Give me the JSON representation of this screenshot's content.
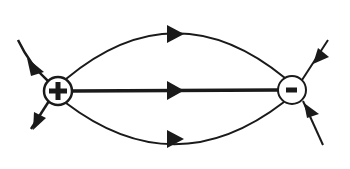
{
  "diagram": {
    "type": "electric-field-lines-dipole",
    "charges": [
      {
        "id": "positive",
        "symbol": "+",
        "cx": 58,
        "cy": 91,
        "r": 14
      },
      {
        "id": "negative",
        "symbol": "-",
        "cx": 292,
        "cy": 90,
        "r": 14
      }
    ],
    "field_lines": [
      {
        "id": "top-arc",
        "direction": "left-to-right"
      },
      {
        "id": "middle-line",
        "direction": "left-to-right"
      },
      {
        "id": "bottom-arc",
        "direction": "left-to-right"
      },
      {
        "id": "positive-out-upper-left",
        "direction": "outward"
      },
      {
        "id": "positive-out-lower-left",
        "direction": "outward"
      },
      {
        "id": "negative-in-upper-right",
        "direction": "inward"
      },
      {
        "id": "negative-in-lower-right",
        "direction": "inward"
      }
    ],
    "colors": {
      "line": "#1a1a1a",
      "background": "#ffffff"
    }
  }
}
